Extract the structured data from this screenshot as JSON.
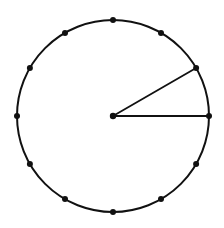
{
  "diagram": {
    "type": "clock-face",
    "canvas": {
      "width": 224,
      "height": 228
    },
    "center": {
      "x": 113,
      "y": 116
    },
    "radius": 96,
    "stroke_color": "#111111",
    "background_color": "#ffffff",
    "hour_dot_count": 12,
    "hour_dot_radius": 3,
    "center_dot_radius": 3.2,
    "hands": [
      {
        "name": "hand-to-3",
        "hour_position": 3
      },
      {
        "name": "hand-to-2",
        "hour_position": 2
      }
    ]
  }
}
